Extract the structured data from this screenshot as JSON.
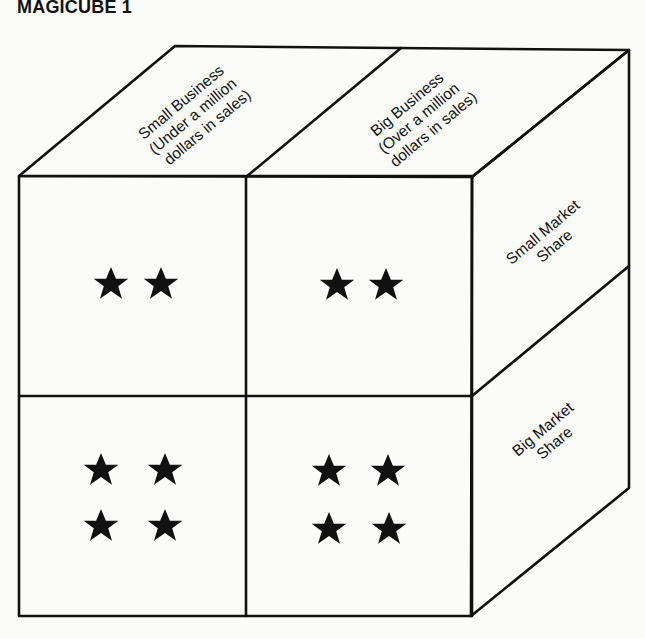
{
  "title": "MAGICUBE 1",
  "top_face": {
    "columns": [
      {
        "line1": "Small Business",
        "line2": "(Under a million",
        "line3": "dollars in sales)"
      },
      {
        "line1": "Big Business",
        "line2": "(Over a million",
        "line3": "dollars in sales)"
      }
    ]
  },
  "side_face": {
    "rows": [
      {
        "line1": "Small Market",
        "line2": "Share"
      },
      {
        "line1": "Big Market",
        "line2": "Share"
      }
    ]
  },
  "front_face": {
    "cells": [
      {
        "position": "top-left",
        "business": "Small Business",
        "market_share": "Small Market Share",
        "stars": 2
      },
      {
        "position": "top-right",
        "business": "Big Business",
        "market_share": "Small Market Share",
        "stars": 2
      },
      {
        "position": "bottom-left",
        "business": "Small Business",
        "market_share": "Big Market Share",
        "stars": 4
      },
      {
        "position": "bottom-right",
        "business": "Big Business",
        "market_share": "Big Market Share",
        "stars": 4
      }
    ]
  },
  "colors": {
    "ink": "#111111",
    "paper": "#fbfbf9"
  }
}
